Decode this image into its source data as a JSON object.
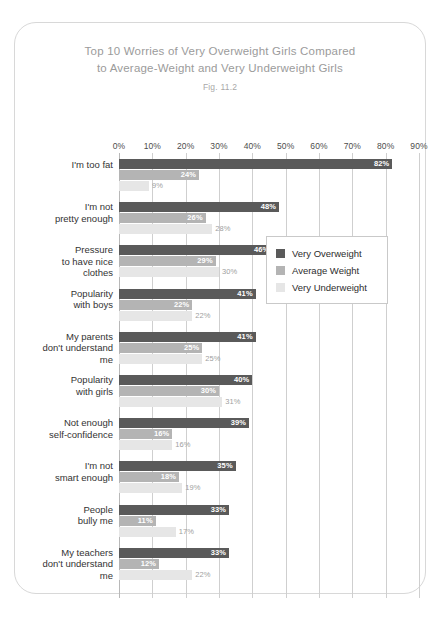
{
  "title": {
    "line1": "Top 10 Worries of Very Overweight Girls Compared",
    "line2": "to Average-Weight and Very Underweight Girls",
    "figure": "Fig. 11.2"
  },
  "legend": {
    "items": [
      {
        "label": "Very Overweight",
        "color": "#5a5a5a"
      },
      {
        "label": "Average Weight",
        "color": "#b4b4b4"
      },
      {
        "label": "Very Underweight",
        "color": "#e6e6e6"
      }
    ]
  },
  "chart_data": {
    "type": "bar",
    "orientation": "horizontal",
    "title": "Top 10 Worries of Very Overweight Girls Compared to Average-Weight and Very Underweight Girls",
    "subtitle": "Fig. 11.2",
    "xlabel": "",
    "ylabel": "",
    "xlim": [
      0,
      90
    ],
    "xticks": [
      "0%",
      "10%",
      "20%",
      "30%",
      "40%",
      "50%",
      "60%",
      "70%",
      "80%",
      "90%"
    ],
    "xtick_values": [
      0,
      10,
      20,
      30,
      40,
      50,
      60,
      70,
      80,
      90
    ],
    "grid": true,
    "legend_position": "center-right",
    "categories": [
      "I'm too fat",
      "I'm not pretty enough",
      "Pressure to have nice clothes",
      "Popularity with boys",
      "My parents don't understand me",
      "Popularity with girls",
      "Not enough self-confidence",
      "I'm not smart enough",
      "People bully me",
      "My teachers don't understand me"
    ],
    "category_lines": [
      [
        "I'm too fat"
      ],
      [
        "I'm not",
        "pretty enough"
      ],
      [
        "Pressure",
        "to have nice",
        "clothes"
      ],
      [
        "Popularity",
        "with boys"
      ],
      [
        "My parents",
        "don't understand",
        "me"
      ],
      [
        "Popularity",
        "with girls"
      ],
      [
        "Not enough",
        "self-confidence"
      ],
      [
        "I'm not",
        "smart enough"
      ],
      [
        "People",
        "bully me"
      ],
      [
        "My teachers",
        "don't understand",
        "me"
      ]
    ],
    "series": [
      {
        "name": "Very Overweight",
        "color": "#5a5a5a",
        "values": [
          82,
          48,
          46,
          41,
          41,
          40,
          39,
          35,
          33,
          33
        ],
        "labels": [
          "82%",
          "48%",
          "46%",
          "41%",
          "41%",
          "40%",
          "39%",
          "35%",
          "33%",
          "33%"
        ]
      },
      {
        "name": "Average Weight",
        "color": "#b4b4b4",
        "values": [
          24,
          26,
          29,
          22,
          25,
          30,
          16,
          18,
          11,
          12
        ],
        "labels": [
          "24%",
          "26%",
          "29%",
          "22%",
          "25%",
          "30%",
          "16%",
          "18%",
          "11%",
          "12%"
        ]
      },
      {
        "name": "Very Underweight",
        "color": "#e6e6e6",
        "values": [
          9,
          28,
          30,
          22,
          25,
          31,
          16,
          19,
          17,
          22
        ],
        "labels": [
          "9%",
          "28%",
          "30%",
          "22%",
          "25%",
          "31%",
          "16%",
          "19%",
          "17%",
          "22%"
        ]
      }
    ]
  }
}
